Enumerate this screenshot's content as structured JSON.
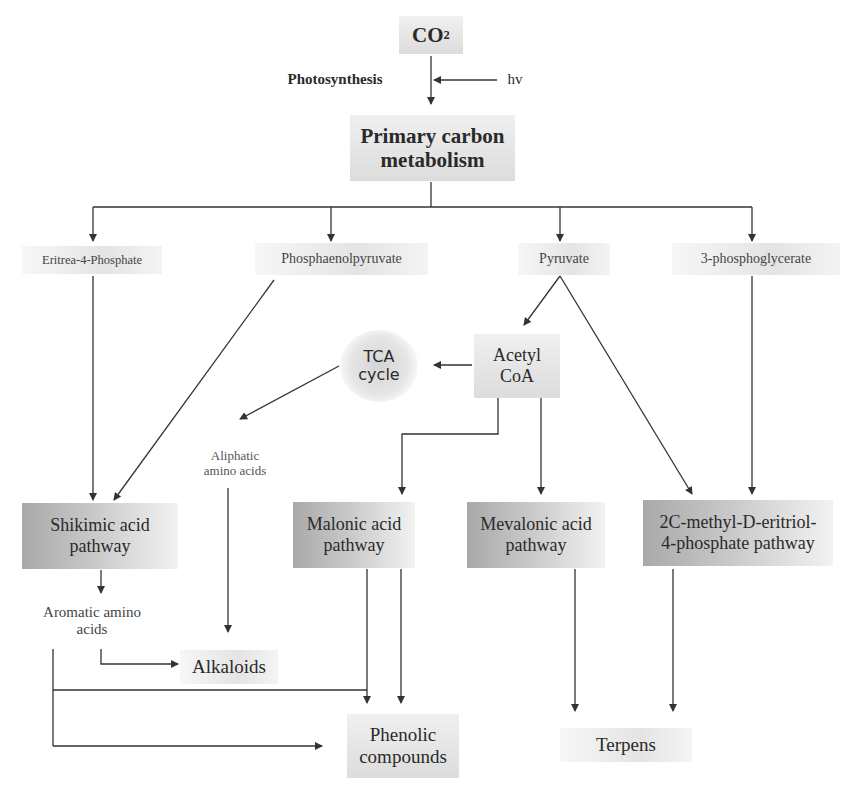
{
  "diagram": {
    "top": {
      "co2": {
        "main": "CO",
        "sub": "2"
      },
      "photosynthesis": "Photosynthesis",
      "hv": "hv",
      "primary": "Primary carbon metabolism"
    },
    "intermediates": {
      "eritrea": "Eritrea-4-Phosphate",
      "pep": "Phosphaenolpyruvate",
      "pyruvate": "Pyruvate",
      "pga": "3-phosphoglycerate",
      "tca": "TCA cycle",
      "acetyl": "Acetyl CoA",
      "aliphatic": "Aliphatic amino acids",
      "aromatic": "Aromatic amino acids"
    },
    "pathways": {
      "shikimic": "Shikimic acid pathway",
      "malonic": "Malonic acid pathway",
      "mevalonic": "Mevalonic acid pathway",
      "mep": "2C-methyl-D-eritriol-4-phosphate pathway"
    },
    "products": {
      "alkaloids": "Alkaloids",
      "phenolic": "Phenolic compounds",
      "terpens": "Terpens"
    }
  }
}
